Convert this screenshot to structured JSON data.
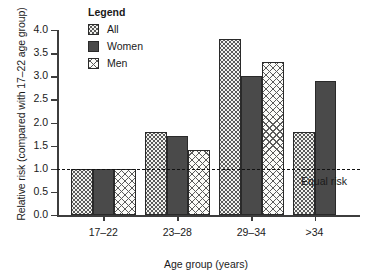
{
  "chart_data": {
    "type": "bar",
    "title": "",
    "xlabel": "Age group (years)",
    "ylabel": "Relative risk (compared with 17–22 age group)",
    "categories": [
      "17–22",
      "23–28",
      "29–34",
      ">34"
    ],
    "series": [
      {
        "name": "All",
        "values": [
          1.0,
          1.8,
          3.8,
          1.8
        ]
      },
      {
        "name": "Women",
        "values": [
          1.0,
          1.7,
          3.0,
          2.9
        ]
      },
      {
        "name": "Men",
        "values": [
          1.0,
          1.4,
          3.3,
          null
        ]
      }
    ],
    "ylim": [
      0.0,
      4.0
    ],
    "yticks": [
      "0.0",
      "0.5",
      "1.0",
      "1.5",
      "2.0",
      "2.5",
      "3.0",
      "3.5",
      "4.0"
    ],
    "ytick_values": [
      0.0,
      0.5,
      1.0,
      1.5,
      2.0,
      2.5,
      3.0,
      3.5,
      4.0
    ],
    "grid": false,
    "legend_position": "top-left-inside",
    "annotations": [
      {
        "name": "equal-risk",
        "label": "Equal risk",
        "y_value": 1.0,
        "style": "dashed-horizontal-line"
      }
    ]
  },
  "legend": {
    "title": "Legend",
    "items": [
      {
        "label": "All",
        "pattern": "dotted-stipple",
        "color": "#f2f2ee"
      },
      {
        "label": "Women",
        "pattern": "solid-fill",
        "color": "#4a4a4a"
      },
      {
        "label": "Men",
        "pattern": "cross-hatch",
        "color": "#fbfbf8"
      }
    ]
  },
  "colors": {
    "axis": "#3d3d3d",
    "bar_outline": "#2a2a2a",
    "women_fill": "#4a4a4a",
    "all_fill": "#f2f2ee",
    "men_fill": "#fbfbf8",
    "reference_line": "#111111",
    "background": "#ffffff"
  }
}
